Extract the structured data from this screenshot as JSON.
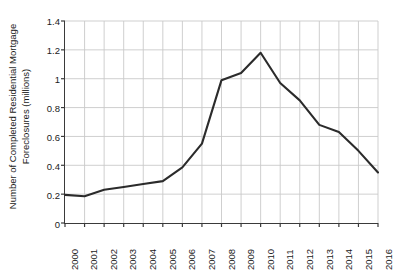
{
  "chart_data": {
    "type": "line",
    "title": "",
    "xlabel": "",
    "ylabel": "Number of Completed Residential Mortgage Foreclosures (millions)",
    "ylabel_lines": [
      "Number of Completed Residential Mortgage",
      "Foreclosures (millions)"
    ],
    "categories": [
      "2000",
      "2001",
      "2002",
      "2003",
      "2004",
      "2005",
      "2006",
      "2007",
      "2008",
      "2009",
      "2010",
      "2011",
      "2012",
      "2013",
      "2014",
      "2015",
      "2016"
    ],
    "values": [
      0.195,
      0.185,
      0.23,
      0.25,
      0.27,
      0.29,
      0.385,
      0.55,
      0.99,
      1.04,
      1.18,
      0.97,
      0.85,
      0.68,
      0.63,
      0.5,
      0.35
    ],
    "series": [
      {
        "name": "Completed Residential Mortgage Foreclosures",
        "values": [
          0.195,
          0.185,
          0.23,
          0.25,
          0.27,
          0.29,
          0.385,
          0.55,
          0.99,
          1.04,
          1.18,
          0.97,
          0.85,
          0.68,
          0.63,
          0.5,
          0.35
        ],
        "color": "#2b2b2b"
      }
    ],
    "x_tick_labels": [
      "2000",
      "2001",
      "2002",
      "2003",
      "2004",
      "2005",
      "2006",
      "2007",
      "2008",
      "2009",
      "2010",
      "2011",
      "2012",
      "2013",
      "2014",
      "2015",
      "2016"
    ],
    "y_tick_labels": [
      "0",
      "0.2",
      "0.4",
      "0.6",
      "0.8",
      "1",
      "1.2",
      "1.4"
    ],
    "y_tick_values": [
      0,
      0.2,
      0.4,
      0.6,
      0.8,
      1.0,
      1.2,
      1.4
    ],
    "ylim": [
      0,
      1.4
    ],
    "xlim": [
      2000,
      2016
    ],
    "grid": true,
    "grid_color": "#c9c9c9",
    "axis_color": "#3a3a3a",
    "legend": "none",
    "background": "#ffffff",
    "peak": {
      "category": "2010",
      "value": 1.18
    },
    "minimum": {
      "category": "2001",
      "value": 0.185
    }
  }
}
